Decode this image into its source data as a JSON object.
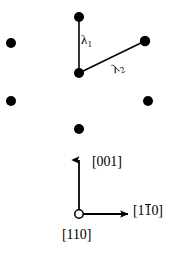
{
  "figure": {
    "background_color": "#ffffff",
    "ink_color": "#000000",
    "width": 180,
    "height": 253
  },
  "lattice": {
    "dot_radius": 5.0,
    "dot_color": "#000000",
    "atoms": [
      {
        "name": "atom-top-center",
        "x": 79,
        "y": 17
      },
      {
        "name": "atom-left-upper",
        "x": 11,
        "y": 43
      },
      {
        "name": "atom-right-upper",
        "x": 145,
        "y": 41
      },
      {
        "name": "atom-center",
        "x": 79,
        "y": 73
      },
      {
        "name": "atom-left-lower",
        "x": 11,
        "y": 101
      },
      {
        "name": "atom-right-lower",
        "x": 148,
        "y": 101
      },
      {
        "name": "atom-bottom-center",
        "x": 79,
        "y": 129
      }
    ]
  },
  "spacings": [
    {
      "id": "lambda1",
      "label": "λ",
      "subscript": "1",
      "from": {
        "x": 79,
        "y": 73
      },
      "to": {
        "x": 79,
        "y": 17
      },
      "stroke_width": 1.6
    },
    {
      "id": "lambda2",
      "label": "λ",
      "subscript": "2",
      "from": {
        "x": 79,
        "y": 73
      },
      "to": {
        "x": 145,
        "y": 41
      },
      "stroke_width": 1.6
    }
  ],
  "axes": {
    "origin": {
      "x": 79,
      "y": 214
    },
    "origin_marker": "open-circle",
    "origin_marker_radius": 4.2,
    "vertical": {
      "label_prefix": "[",
      "label_digits": "001",
      "label_suffix": "]",
      "label_full": "[001]",
      "overbar_index": -1,
      "tip": {
        "x": 79,
        "y": 158
      },
      "stroke_width": 1.8
    },
    "horizontal": {
      "label_prefix": "[",
      "label_digit_1": "1",
      "label_digit_2": "1",
      "label_digit_3": "0",
      "label_suffix": "]",
      "label_full": "[1̱0]",
      "overbar_index": 1,
      "tip": {
        "x": 130,
        "y": 214
      },
      "stroke_width": 1.8
    },
    "out_of_plane": {
      "label_prefix": "[",
      "label_digits": "110",
      "label_suffix": "]",
      "label_full": "[110]",
      "overbar_index": -1
    }
  }
}
